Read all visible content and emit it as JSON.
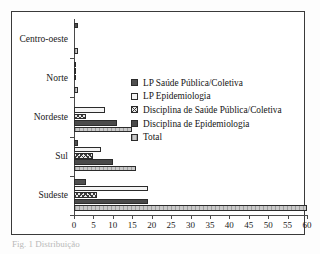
{
  "chart_data": {
    "type": "bar",
    "orientation": "horizontal",
    "title": "",
    "xlabel": "",
    "ylabel": "",
    "categories": [
      "Centro-oeste",
      "Norte",
      "Nordeste",
      "Sul",
      "Sudeste"
    ],
    "series": [
      {
        "name": "LP Saúde Pública/Coletiva",
        "key": "s0",
        "values": [
          1,
          0.5,
          0,
          1,
          3
        ]
      },
      {
        "name": "LP Epidemiologia",
        "key": "s1",
        "values": [
          0,
          0.5,
          8,
          7,
          19
        ]
      },
      {
        "name": "Disciplina de Saúde Pública/Coletiva",
        "key": "s2",
        "values": [
          0,
          0.5,
          3,
          5,
          6
        ]
      },
      {
        "name": "Disciplina de Epidemiologia",
        "key": "s3",
        "values": [
          0,
          0,
          11,
          10,
          19
        ]
      },
      {
        "name": "Total",
        "key": "s4",
        "values": [
          1,
          1,
          15,
          16,
          60
        ]
      }
    ],
    "xlim": [
      0,
      60
    ],
    "xticks": [
      0,
      5,
      10,
      15,
      20,
      25,
      30,
      35,
      40,
      45,
      50,
      55,
      60
    ],
    "xtick_labels": [
      "0",
      "5",
      "10",
      "15",
      "20",
      "25",
      "30",
      "35",
      "40",
      "45",
      "50",
      "55",
      "60"
    ],
    "grid": false,
    "legend_position": "center-right"
  },
  "legend": {
    "items": [
      {
        "label": "LP Saúde Pública/Coletiva",
        "key": "s0"
      },
      {
        "label": "LP Epidemiologia",
        "key": "s1"
      },
      {
        "label": "Disciplina de Saúde Pública/Coletiva",
        "key": "s2"
      },
      {
        "label": "Disciplina de Epidemiologia",
        "key": "s3"
      },
      {
        "label": "Total",
        "key": "s4"
      }
    ]
  },
  "caption": "Fig. 1 Distribuição"
}
